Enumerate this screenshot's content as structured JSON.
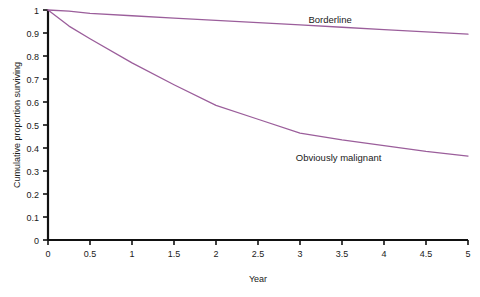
{
  "chart_data": {
    "type": "line",
    "title": "",
    "xlabel": "Year",
    "ylabel": "Cumulative proportion surviving",
    "xlim": [
      0,
      5
    ],
    "ylim": [
      0,
      1
    ],
    "xticks": [
      "0",
      "0.5",
      "1",
      "1.5",
      "2",
      "2.5",
      "3",
      "3.5",
      "4",
      "4.5",
      "5"
    ],
    "yticks": [
      "0",
      "0.1",
      "0.2",
      "0.3",
      "0.4",
      "0.5",
      "0.6",
      "0.7",
      "0.8",
      "0.9",
      "1"
    ],
    "grid": false,
    "legend_position": "inline-annotations",
    "series": [
      {
        "name": "Borderline",
        "color": "#9b5e9b",
        "x": [
          0,
          0.25,
          0.5,
          1,
          1.5,
          2,
          2.5,
          3,
          3.5,
          4,
          4.5,
          5
        ],
        "values": [
          1.0,
          0.995,
          0.985,
          0.975,
          0.965,
          0.955,
          0.945,
          0.935,
          0.925,
          0.915,
          0.905,
          0.895
        ]
      },
      {
        "name": "Obviously malignant",
        "color": "#9b5e9b",
        "x": [
          0,
          0.25,
          0.5,
          1,
          1.5,
          2,
          2.5,
          3,
          3.5,
          4,
          4.5,
          5
        ],
        "values": [
          1.0,
          0.93,
          0.875,
          0.77,
          0.675,
          0.585,
          0.525,
          0.465,
          0.435,
          0.41,
          0.385,
          0.365
        ]
      }
    ],
    "annotations": [
      {
        "text": "Borderline",
        "x": 3.1,
        "y": 0.945
      },
      {
        "text": "Obviously malignant",
        "x": 2.95,
        "y": 0.345
      }
    ]
  }
}
